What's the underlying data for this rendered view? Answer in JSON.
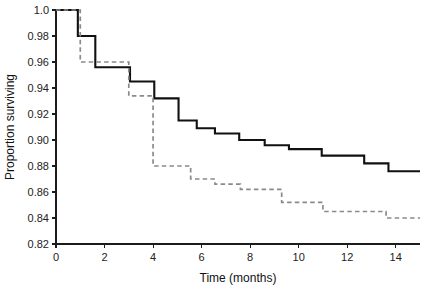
{
  "chart_data": {
    "type": "line",
    "subtype": "kaplan-meier-step",
    "title": "",
    "xlabel": "Time (months)",
    "ylabel": "Proportion surviving",
    "xlim": [
      0,
      15
    ],
    "ylim": [
      0.82,
      1.0
    ],
    "xticks": [
      0,
      2,
      4,
      6,
      8,
      10,
      12,
      14
    ],
    "xtick_labels": [
      "0",
      "2",
      "4",
      "6",
      "8",
      "10",
      "12",
      "14"
    ],
    "yticks": [
      0.82,
      0.84,
      0.86,
      0.88,
      0.9,
      0.92,
      0.94,
      0.96,
      0.98,
      1.0
    ],
    "ytick_labels": [
      "0.82",
      "0.84",
      "0.86",
      "0.88",
      "0.90",
      "0.92",
      "0.94",
      "0.96",
      "0.98",
      "1.0"
    ],
    "grid": false,
    "legend": "none",
    "series": [
      {
        "name": "solid-curve",
        "style": "solid",
        "color": "#111111",
        "points": [
          {
            "x": 0.0,
            "y": 1.0
          },
          {
            "x": 0.9,
            "y": 1.0
          },
          {
            "x": 0.9,
            "y": 0.98
          },
          {
            "x": 1.62,
            "y": 0.98
          },
          {
            "x": 1.62,
            "y": 0.956
          },
          {
            "x": 3.05,
            "y": 0.956
          },
          {
            "x": 3.05,
            "y": 0.945
          },
          {
            "x": 4.05,
            "y": 0.945
          },
          {
            "x": 4.05,
            "y": 0.932
          },
          {
            "x": 5.05,
            "y": 0.932
          },
          {
            "x": 5.05,
            "y": 0.915
          },
          {
            "x": 5.8,
            "y": 0.915
          },
          {
            "x": 5.8,
            "y": 0.909
          },
          {
            "x": 6.55,
            "y": 0.909
          },
          {
            "x": 6.55,
            "y": 0.905
          },
          {
            "x": 7.55,
            "y": 0.905
          },
          {
            "x": 7.55,
            "y": 0.9
          },
          {
            "x": 8.6,
            "y": 0.9
          },
          {
            "x": 8.6,
            "y": 0.896
          },
          {
            "x": 9.6,
            "y": 0.896
          },
          {
            "x": 9.6,
            "y": 0.893
          },
          {
            "x": 10.95,
            "y": 0.893
          },
          {
            "x": 10.95,
            "y": 0.888
          },
          {
            "x": 12.7,
            "y": 0.888
          },
          {
            "x": 12.7,
            "y": 0.882
          },
          {
            "x": 13.7,
            "y": 0.882
          },
          {
            "x": 13.7,
            "y": 0.876
          },
          {
            "x": 15.0,
            "y": 0.876
          }
        ]
      },
      {
        "name": "dashed-curve",
        "style": "dashed",
        "color": "#8a8a8a",
        "points": [
          {
            "x": 0.0,
            "y": 1.0
          },
          {
            "x": 1.0,
            "y": 1.0
          },
          {
            "x": 1.0,
            "y": 0.96
          },
          {
            "x": 3.0,
            "y": 0.96
          },
          {
            "x": 3.0,
            "y": 0.934
          },
          {
            "x": 4.0,
            "y": 0.934
          },
          {
            "x": 4.0,
            "y": 0.88
          },
          {
            "x": 5.55,
            "y": 0.88
          },
          {
            "x": 5.55,
            "y": 0.87
          },
          {
            "x": 6.55,
            "y": 0.87
          },
          {
            "x": 6.55,
            "y": 0.866
          },
          {
            "x": 7.6,
            "y": 0.866
          },
          {
            "x": 7.6,
            "y": 0.862
          },
          {
            "x": 9.3,
            "y": 0.862
          },
          {
            "x": 9.3,
            "y": 0.852
          },
          {
            "x": 11.0,
            "y": 0.852
          },
          {
            "x": 11.0,
            "y": 0.845
          },
          {
            "x": 13.6,
            "y": 0.845
          },
          {
            "x": 13.6,
            "y": 0.84
          },
          {
            "x": 15.0,
            "y": 0.84
          }
        ]
      }
    ]
  }
}
